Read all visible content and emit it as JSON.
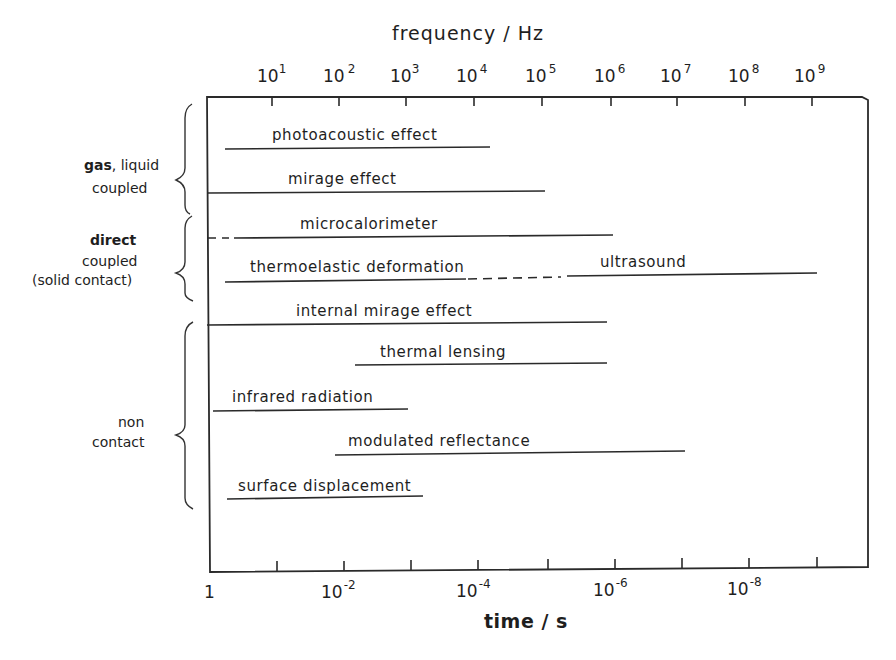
{
  "diagram": {
    "top_axis": {
      "title": "frequency / Hz",
      "ticks": [
        {
          "base": "10",
          "exp": "1",
          "x": 272
        },
        {
          "base": "10",
          "exp": "2",
          "x": 339
        },
        {
          "base": "10",
          "exp": "3",
          "x": 406
        },
        {
          "base": "10",
          "exp": "4",
          "x": 474
        },
        {
          "base": "10",
          "exp": "5",
          "x": 542
        },
        {
          "base": "10",
          "exp": "6",
          "x": 611
        },
        {
          "base": "10",
          "exp": "7",
          "x": 677
        },
        {
          "base": "10",
          "exp": "8",
          "x": 745
        },
        {
          "base": "10",
          "exp": "9",
          "x": 812
        }
      ]
    },
    "bottom_axis": {
      "title": "time / s",
      "tick_positions": [
        277,
        344,
        411,
        478,
        548,
        615,
        682,
        749,
        817
      ],
      "labels": [
        {
          "base": "1",
          "exp": "",
          "x": 210
        },
        {
          "base": "10",
          "exp": "-2",
          "x": 344
        },
        {
          "base": "10",
          "exp": "-4",
          "x": 478
        },
        {
          "base": "10",
          "exp": "-6",
          "x": 615
        },
        {
          "base": "10",
          "exp": "-8",
          "x": 749
        }
      ]
    },
    "groups": [
      {
        "label_bold": "gas",
        "label_rest": ", liquid",
        "line2": "coupled",
        "line3": ""
      },
      {
        "label_bold": "direct",
        "label_rest": "",
        "line2": "coupled",
        "line3": "(solid contact)"
      },
      {
        "label_bold": "",
        "label_rest": "non",
        "line2": "contact",
        "line3": ""
      }
    ],
    "techniques": [
      {
        "name": "photoacoustic effect",
        "group": "gas, liquid coupled",
        "y": 148,
        "segments": [
          {
            "x1": 225,
            "x2": 490,
            "style": "solid"
          }
        ],
        "label_x": 272
      },
      {
        "name": "mirage effect",
        "group": "gas, liquid coupled",
        "y": 192,
        "segments": [
          {
            "x1": 207,
            "x2": 545,
            "style": "solid"
          }
        ],
        "label_x": 288
      },
      {
        "name": "microcalorimeter",
        "group": "direct coupled (solid contact)",
        "y": 237,
        "segments": [
          {
            "x1": 207,
            "x2": 229,
            "style": "dashed"
          },
          {
            "x1": 234,
            "x2": 613,
            "style": "solid"
          }
        ],
        "label_x": 300
      },
      {
        "name": "thermoelastic deformation",
        "group": "direct coupled (solid contact)",
        "y": 280,
        "segments": [
          {
            "x1": 225,
            "x2": 466,
            "style": "solid"
          },
          {
            "x1": 468,
            "x2": 561,
            "style": "dashed"
          }
        ],
        "label_x": 250
      },
      {
        "name": "ultrasound",
        "group": "direct coupled (solid contact)",
        "y": 274,
        "segments": [
          {
            "x1": 567,
            "x2": 817,
            "style": "solid"
          }
        ],
        "label_x": 600
      },
      {
        "name": "internal mirage effect",
        "group": "non contact",
        "y": 324,
        "segments": [
          {
            "x1": 207,
            "x2": 607,
            "style": "solid"
          }
        ],
        "label_x": 296
      },
      {
        "name": "thermal lensing",
        "group": "non contact",
        "y": 364,
        "segments": [
          {
            "x1": 355,
            "x2": 607,
            "style": "solid"
          }
        ],
        "label_x": 380
      },
      {
        "name": "infrared radiation",
        "group": "non contact",
        "y": 410,
        "segments": [
          {
            "x1": 213,
            "x2": 408,
            "style": "solid"
          }
        ],
        "label_x": 232
      },
      {
        "name": "modulated reflectance",
        "group": "non contact",
        "y": 453,
        "segments": [
          {
            "x1": 335,
            "x2": 685,
            "style": "solid"
          }
        ],
        "label_x": 348
      },
      {
        "name": "surface displacement",
        "group": "non contact",
        "y": 497,
        "segments": [
          {
            "x1": 227,
            "x2": 423,
            "style": "solid"
          }
        ],
        "label_x": 238
      }
    ]
  }
}
